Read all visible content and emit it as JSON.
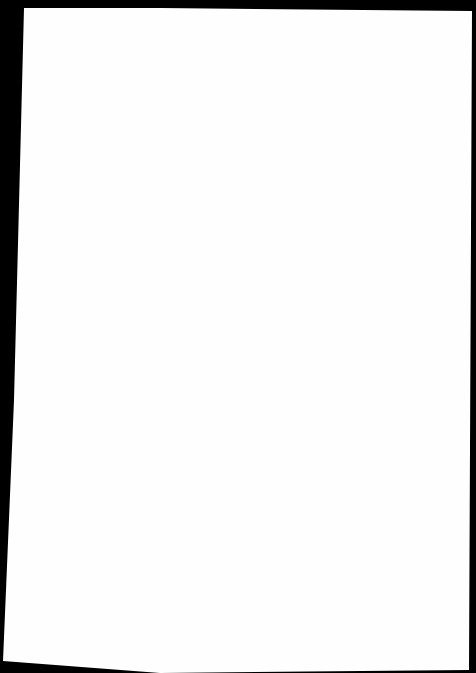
{
  "document": {
    "background_color": "#000000",
    "paper_color": "#fefefe",
    "content": ""
  }
}
